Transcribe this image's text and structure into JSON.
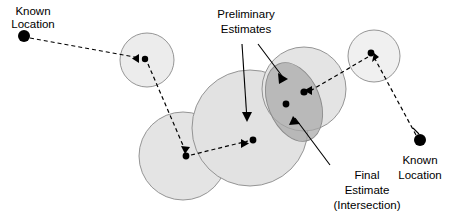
{
  "diagram": {
    "background_color": "#ffffff",
    "stroke_color": "#000000",
    "circle_stroke_color": "#8a8a8a",
    "labels": {
      "known_location_left": {
        "line1": "Known",
        "line2": "Location"
      },
      "known_location_right": {
        "line1": "Known",
        "line2": "Location"
      },
      "preliminary_estimates": {
        "line1": "Preliminary",
        "line2": "Estimates"
      },
      "final_estimate": {
        "line1": "Final",
        "line2": "Estimate",
        "line3": "(Intersection)"
      }
    },
    "uncertainty_regions": [
      {
        "name": "top-left-small-circle",
        "cx": 147,
        "cy": 60,
        "r": 27,
        "fill": "#ececec"
      },
      {
        "name": "bottom-left-circle",
        "cx": 183,
        "cy": 156,
        "r": 44,
        "fill": "#e4e4e4"
      },
      {
        "name": "large-center-circle",
        "cx": 250,
        "cy": 128,
        "r": 58,
        "fill": "#e2e2e2"
      },
      {
        "name": "right-middle-circle",
        "cx": 304,
        "cy": 89,
        "r": 42,
        "fill": "#e4e4e4"
      },
      {
        "name": "top-right-small-circle",
        "cx": 374,
        "cy": 56,
        "r": 26,
        "fill": "#f0f0f0"
      }
    ],
    "intersection_region": {
      "name": "final-estimate-ellipse",
      "cx": 294,
      "cy": 102,
      "rx": 26,
      "ry": 41,
      "rotation": -22,
      "fill": "#a8a8a8",
      "opacity": 0.72
    },
    "known_location_markers": [
      {
        "name": "known-location-left-dot",
        "cx": 24,
        "cy": 36,
        "r": 6
      },
      {
        "name": "known-location-right-dot",
        "cx": 420,
        "cy": 140,
        "r": 6
      }
    ],
    "estimate_dots": [
      {
        "name": "estimate-dot-1",
        "cx": 145,
        "cy": 59,
        "r": 3.2
      },
      {
        "name": "estimate-dot-2",
        "cx": 186,
        "cy": 156,
        "r": 3.4
      },
      {
        "name": "estimate-dot-3",
        "cx": 253,
        "cy": 140,
        "r": 3.4
      },
      {
        "name": "estimate-dot-4",
        "cx": 304,
        "cy": 92,
        "r": 3.6
      },
      {
        "name": "estimate-dot-5",
        "cx": 286,
        "cy": 104,
        "r": 3.4
      },
      {
        "name": "estimate-dot-6",
        "cx": 371,
        "cy": 53,
        "r": 3.4
      }
    ],
    "measurement_links": [
      {
        "name": "link-left-known-to-estimate-1",
        "x1": 30,
        "y1": 38,
        "x2": 140,
        "y2": 58
      },
      {
        "name": "link-estimate-1-to-estimate-2",
        "x1": 148,
        "y1": 64,
        "x2": 185,
        "y2": 150
      },
      {
        "name": "link-estimate-2-to-estimate-3",
        "x1": 191,
        "y1": 155,
        "x2": 248,
        "y2": 141
      },
      {
        "name": "link-estimate-4-to-estimate-6",
        "x1": 368,
        "y1": 57,
        "x2": 310,
        "y2": 91
      },
      {
        "name": "link-right-known-to-estimate-6",
        "x1": 416,
        "y1": 135,
        "x2": 375,
        "y2": 59
      }
    ],
    "annotation_leaders": [
      {
        "name": "leader-preliminary-to-large-circle",
        "x1": 242,
        "y1": 44,
        "x2": 247,
        "y2": 120
      },
      {
        "name": "leader-preliminary-to-ellipse",
        "x1": 258,
        "y1": 44,
        "x2": 285,
        "y2": 80
      },
      {
        "name": "leader-final-estimate-to-ellipse",
        "x1": 330,
        "y1": 165,
        "x2": 295,
        "y2": 118
      },
      {
        "name": "leader-right-known-to-dot",
        "x1": 413,
        "y1": 128,
        "x2": 419,
        "y2": 134
      }
    ]
  }
}
